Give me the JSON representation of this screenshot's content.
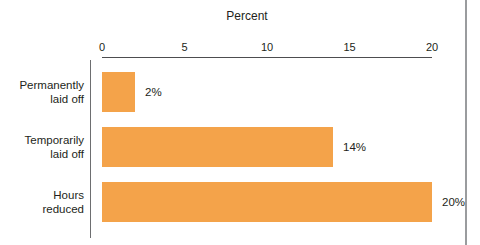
{
  "chart_data": {
    "type": "bar",
    "orientation": "horizontal",
    "title": "Percent",
    "categories": [
      "Permanently\nlaid off",
      "Temporarily\nlaid off",
      "Hours\nreduced"
    ],
    "values": [
      2,
      14,
      20
    ],
    "value_labels": [
      "2%",
      "14%",
      "20%"
    ],
    "xlabel": "Percent",
    "ylabel": "",
    "xlim": [
      0,
      20
    ],
    "axis_ticks": [
      "0",
      "5",
      "10",
      "15",
      "20"
    ],
    "axis_position": "top",
    "grid": false,
    "legend": false
  },
  "colors": {
    "bar": "#F4A34A",
    "text": "#231f20",
    "x_axis_line": "#4d4d4f",
    "category_axis_line": "#6d6e70",
    "frame_border": "#9a9c9e"
  }
}
